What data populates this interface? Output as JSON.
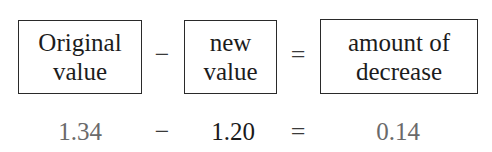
{
  "equation_words": {
    "term1": {
      "line1": "Original",
      "line2": "value"
    },
    "operator1": "−",
    "term2": {
      "line1": "new",
      "line2": "value"
    },
    "operator2": "=",
    "result": {
      "line1": "amount of",
      "line2": "decrease"
    }
  },
  "equation_numbers": {
    "term1": "1.34",
    "operator1": "−",
    "term2": "1.20",
    "operator2": "=",
    "result": "0.14"
  }
}
